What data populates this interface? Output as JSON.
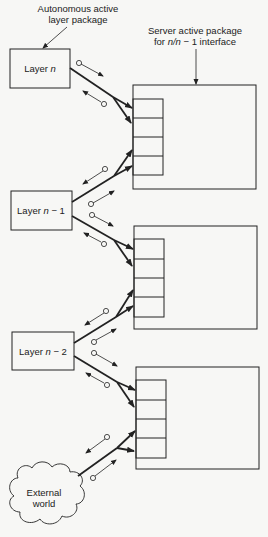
{
  "annotations": {
    "autonomous_line1": "Autonomous active",
    "autonomous_line2": "layer package",
    "server_line1": "Server active package",
    "server_line2_pre": "for ",
    "server_line2_ital": "n/n",
    "server_line2_post": " − 1 interface"
  },
  "layers": [
    {
      "pre": "Layer ",
      "ital": "n",
      "post": ""
    },
    {
      "pre": "Layer ",
      "ital": "n",
      "post": " − 1"
    },
    {
      "pre": "Layer ",
      "ital": "n",
      "post": " − 2"
    }
  ],
  "external": {
    "line1": "External",
    "line2": "world"
  },
  "colors": {
    "ink": "#222222",
    "background": "#f7f7f5"
  }
}
